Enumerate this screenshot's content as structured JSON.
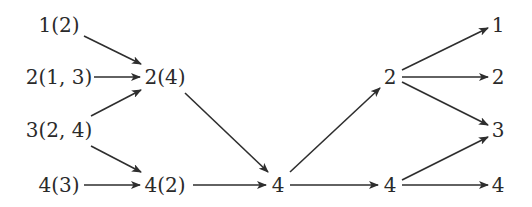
{
  "diagram": {
    "type": "directed-graph",
    "nodes": [
      {
        "id": "a1",
        "label": "1(2)",
        "x": 59,
        "y": 25,
        "anchor": "middle"
      },
      {
        "id": "a2",
        "label": "2(1, 3)",
        "x": 59,
        "y": 77,
        "anchor": "middle"
      },
      {
        "id": "a3",
        "label": "3(2, 4)",
        "x": 59,
        "y": 130,
        "anchor": "middle"
      },
      {
        "id": "a4",
        "label": "4(3)",
        "x": 59,
        "y": 185,
        "anchor": "middle"
      },
      {
        "id": "b2",
        "label": "2(4)",
        "x": 165,
        "y": 77,
        "anchor": "middle"
      },
      {
        "id": "b4",
        "label": "4(2)",
        "x": 165,
        "y": 185,
        "anchor": "middle"
      },
      {
        "id": "c4",
        "label": "4",
        "x": 278,
        "y": 185,
        "anchor": "middle"
      },
      {
        "id": "d2",
        "label": "2",
        "x": 390,
        "y": 77,
        "anchor": "middle"
      },
      {
        "id": "d4",
        "label": "4",
        "x": 390,
        "y": 185,
        "anchor": "middle"
      },
      {
        "id": "e1",
        "label": "1",
        "x": 498,
        "y": 25,
        "anchor": "middle"
      },
      {
        "id": "e2",
        "label": "2",
        "x": 498,
        "y": 77,
        "anchor": "middle"
      },
      {
        "id": "e3",
        "label": "3",
        "x": 498,
        "y": 130,
        "anchor": "middle"
      },
      {
        "id": "e4",
        "label": "4",
        "x": 498,
        "y": 185,
        "anchor": "middle"
      }
    ],
    "edges": [
      {
        "from": "a1",
        "to": "b2",
        "x1": 84,
        "y1": 36,
        "x2": 141,
        "y2": 64
      },
      {
        "from": "a2",
        "to": "b2",
        "x1": 94,
        "y1": 77,
        "x2": 140,
        "y2": 77
      },
      {
        "from": "a3",
        "to": "b2",
        "x1": 91,
        "y1": 116,
        "x2": 141,
        "y2": 90
      },
      {
        "from": "a3",
        "to": "b4",
        "x1": 91,
        "y1": 146,
        "x2": 141,
        "y2": 172
      },
      {
        "from": "a4",
        "to": "b4",
        "x1": 84,
        "y1": 185,
        "x2": 140,
        "y2": 185
      },
      {
        "from": "b2",
        "to": "c4",
        "x1": 185,
        "y1": 93,
        "x2": 268,
        "y2": 172
      },
      {
        "from": "b4",
        "to": "c4",
        "x1": 193,
        "y1": 185,
        "x2": 266,
        "y2": 185
      },
      {
        "from": "c4",
        "to": "d2",
        "x1": 290,
        "y1": 172,
        "x2": 380,
        "y2": 88
      },
      {
        "from": "c4",
        "to": "d4",
        "x1": 290,
        "y1": 185,
        "x2": 378,
        "y2": 185
      },
      {
        "from": "d2",
        "to": "e1",
        "x1": 402,
        "y1": 70,
        "x2": 488,
        "y2": 28
      },
      {
        "from": "d2",
        "to": "e2",
        "x1": 402,
        "y1": 77,
        "x2": 488,
        "y2": 77
      },
      {
        "from": "d2",
        "to": "e3",
        "x1": 402,
        "y1": 82,
        "x2": 488,
        "y2": 125
      },
      {
        "from": "d4",
        "to": "e3",
        "x1": 402,
        "y1": 180,
        "x2": 488,
        "y2": 137
      },
      {
        "from": "d4",
        "to": "e4",
        "x1": 402,
        "y1": 185,
        "x2": 488,
        "y2": 185
      }
    ]
  }
}
